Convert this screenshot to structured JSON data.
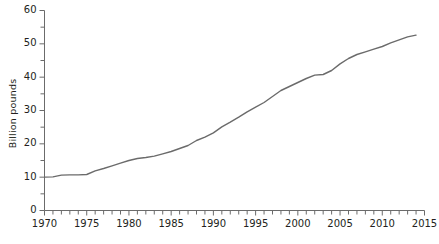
{
  "chart_data": {
    "type": "line",
    "title": "",
    "subtitle": "",
    "xlabel": "",
    "ylabel": "Billion pounds",
    "xlim": [
      1970,
      2015
    ],
    "ylim": [
      0,
      60
    ],
    "grid": false,
    "legend": null,
    "x_major_ticks": [
      1970,
      1975,
      1980,
      1985,
      1990,
      1995,
      2000,
      2005,
      2010,
      2015
    ],
    "x_minor_tick_interval": 1,
    "y_major_ticks": [
      0,
      10,
      20,
      30,
      40,
      50,
      60
    ],
    "y_minor_ticks": [
      5,
      15,
      25,
      35,
      45,
      55
    ],
    "x_tick_labels": [
      "1970",
      "1975",
      "1980",
      "1985",
      "1990",
      "1995",
      "2000",
      "2005",
      "2010",
      "2015"
    ],
    "y_tick_labels": [
      "0",
      "10",
      "20",
      "30",
      "40",
      "50",
      "60"
    ],
    "line_color": "#6b6b6b",
    "axis_color": "#6b6b6b",
    "series": [
      {
        "name": "Billion pounds",
        "x": [
          1970,
          1971,
          1972,
          1973,
          1974,
          1975,
          1976,
          1977,
          1978,
          1979,
          1980,
          1981,
          1982,
          1983,
          1984,
          1985,
          1986,
          1987,
          1988,
          1989,
          1990,
          1991,
          1992,
          1993,
          1994,
          1995,
          1996,
          1997,
          1998,
          1999,
          2000,
          2001,
          2002,
          2003,
          2004,
          2005,
          2006,
          2007,
          2008,
          2009,
          2010,
          2011,
          2012,
          2013,
          2014
        ],
        "values": [
          10.0,
          10.1,
          10.6,
          10.7,
          10.7,
          10.8,
          11.9,
          12.6,
          13.4,
          14.2,
          15.0,
          15.6,
          15.9,
          16.3,
          17.0,
          17.7,
          18.6,
          19.5,
          21.0,
          22.0,
          23.3,
          25.1,
          26.5,
          28.0,
          29.6,
          31.0,
          32.4,
          34.2,
          36.0,
          37.2,
          38.4,
          39.6,
          40.6,
          40.8,
          42.0,
          44.0,
          45.6,
          46.8,
          47.6,
          48.4,
          49.2,
          50.3,
          51.2,
          52.1,
          52.6
        ]
      }
    ]
  }
}
